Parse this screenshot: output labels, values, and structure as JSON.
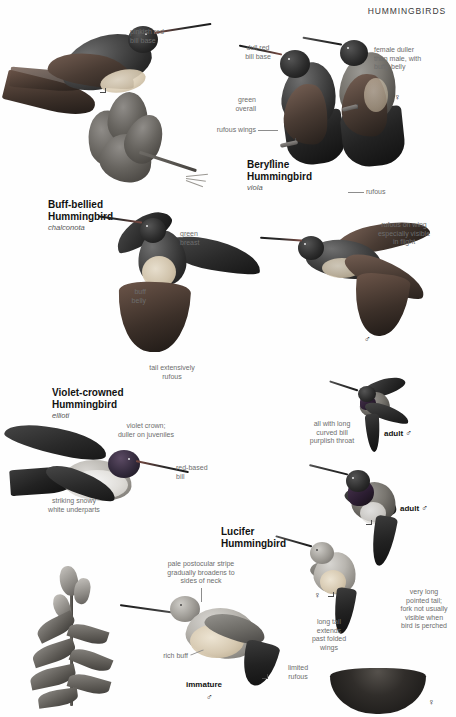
{
  "header": {
    "title": "HUMMINGBIRDS"
  },
  "species": [
    {
      "id": "buff-bellied",
      "name": "Buff-bellied\nHummingbird",
      "subspecies": "chalconota"
    },
    {
      "id": "berylline",
      "name": "Berylline\nHummingbird",
      "subspecies": "viola"
    },
    {
      "id": "violet-crowned",
      "name": "Violet-crowned\nHummingbird",
      "subspecies": "ellioti"
    },
    {
      "id": "lucifer",
      "name": "Lucifer\nHummingbird",
      "subspecies": ""
    }
  ],
  "annotations": {
    "pinkish_red_bill_base": "pinkish red\nbill base",
    "dull_red_bill_base": "dull red\nbill base",
    "female_duller": "female duller\nthan male, with\nbuffy belly",
    "green_overall": "green\noverall",
    "rufous_wings": "rufous wings",
    "rufous": "rufous",
    "green_breast": "green\nbreast",
    "buff_belly": "buff\nbelly",
    "tail_extensively_rufous": "tail extensively\nrufous",
    "rufous_on_wing": "rufous on wing\nespecially visible\nin flight",
    "violet_crown": "violet crown;\nduller on juveniles",
    "red_based_bill": "red-based\nbill",
    "striking_snowy": "striking snowy\nwhite underparts",
    "all_with_long": "all with long\ncurved bill\npurplish throat",
    "pale_postocular": "pale postocular stripe\ngradually broadens to\nsides of neck",
    "very_long_pointed_tail": "very long\npointed tail;\nfork not usually\nvisible when\nbird is perched",
    "long_tail_extends": "long tail\nextends\npast folded\nwings",
    "rich_buff": "rich buff",
    "limited_rufous": "limited\nrufous"
  },
  "age_labels": {
    "adult_male_upper": "adult",
    "adult_male_lower": "adult",
    "immature": "immature"
  },
  "symbols": {
    "male": "♂",
    "female": "♀"
  },
  "colors": {
    "text_primary": "#111111",
    "text_annotation": "#6d6d6d",
    "leader_line": "#8d8d8d",
    "page_background": "#ffffff"
  }
}
